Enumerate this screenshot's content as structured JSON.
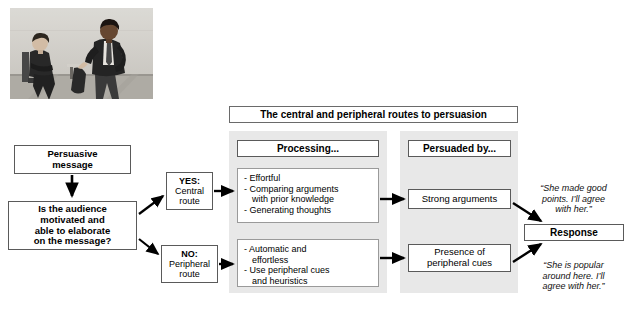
{
  "figure": {
    "title": "The central and peripheral routes to persuasion",
    "photo_alt": "Two business colleagues talking, one seated and one standing"
  },
  "flow": {
    "stimulus": "Persuasive\nmessage",
    "question": "Is the audience\nmotivated and\nable to elaborate\non the message?",
    "branches": [
      {
        "decision": "YES:",
        "route": "Central\nroute"
      },
      {
        "decision": "NO:",
        "route": "Peripheral\nroute"
      }
    ]
  },
  "columns": {
    "processing_header": "Processing...",
    "persuaded_header": "Persuaded by...",
    "response_header": "Response"
  },
  "central": {
    "processing": [
      "- Effortful",
      "- Comparing arguments\n  with prior knowledge",
      "- Generating thoughts"
    ],
    "persuaded_by": "Strong arguments",
    "response_quote": "“She made good\npoints. I’ll agree\nwith her.”"
  },
  "peripheral": {
    "processing": [
      "- Automatic and\n  effortless",
      "- Use peripheral cues\n  and heuristics"
    ],
    "persuaded_by": "Presence of\nperipheral cues",
    "response_quote": "“She is popular\naround here. I’ll\nagree with her.”"
  },
  "colors": {
    "panel_background": "#e8e8e8",
    "box_border": "#5a5a5a",
    "arrow": "#000000",
    "page_background": "#ffffff"
  }
}
